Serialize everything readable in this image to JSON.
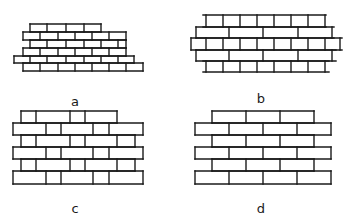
{
  "figure": {
    "panels": [
      {
        "id": "a",
        "label": "a",
        "label_pos": [
          75,
          95
        ],
        "description": "Stepped/raking brick bond, courses offset progressively",
        "courses": [
          {
            "y0": 24,
            "y1": 32,
            "x0": 30,
            "x1": 101,
            "joints": [
              47,
              66,
              84
            ]
          },
          {
            "y0": 32,
            "y1": 40,
            "x0": 23,
            "x1": 126,
            "joints": [
              40,
              58,
              75,
              92,
              109
            ]
          },
          {
            "y0": 40,
            "y1": 48,
            "x0": 30,
            "x1": 126,
            "joints": [
              47,
              66,
              84,
              101,
              118
            ]
          },
          {
            "y0": 48,
            "y1": 56,
            "x0": 23,
            "x1": 126,
            "joints": [
              40,
              58,
              75,
              92,
              109
            ]
          },
          {
            "y0": 56,
            "y1": 63,
            "x0": 14,
            "x1": 134,
            "joints": [
              30,
              47,
              66,
              84,
              101,
              118
            ]
          },
          {
            "y0": 63,
            "y1": 71,
            "x0": 23,
            "x1": 143,
            "joints": [
              40,
              58,
              75,
              92,
              109,
              126
            ]
          }
        ]
      },
      {
        "id": "b",
        "label": "b",
        "label_pos": [
          261,
          92
        ],
        "description": "Alternating courses of headers and stretchers with projecting course lines",
        "courses": [
          {
            "y0": 15,
            "y1": 27,
            "x0": 203,
            "x1": 326,
            "joints": [
              206,
              223,
              240,
              257,
              274,
              291,
              308,
              325
            ],
            "line_ext": [
              203,
              326
            ]
          },
          {
            "y0": 27,
            "y1": 38,
            "x0": 196,
            "x1": 334,
            "joints": [
              196,
              229,
              263,
              298,
              332
            ],
            "line_ext": [
              196,
              334
            ]
          },
          {
            "y0": 38,
            "y1": 50,
            "x0": 191,
            "x1": 340,
            "joints": [
              191,
              206,
              223,
              240,
              257,
              274,
              291,
              308,
              325,
              340
            ],
            "line_ext": [
              191,
              342
            ]
          },
          {
            "y0": 50,
            "y1": 61,
            "x0": 196,
            "x1": 334,
            "joints": [
              196,
              229,
              263,
              298,
              332
            ],
            "line_ext": [
              196,
              336
            ]
          },
          {
            "y0": 61,
            "y1": 72,
            "x0": 203,
            "x1": 326,
            "joints": [
              206,
              223,
              240,
              257,
              274,
              291,
              308,
              325
            ],
            "line_ext": [
              203,
              329
            ]
          }
        ]
      },
      {
        "id": "c",
        "label": "c",
        "label_pos": [
          75,
          202
        ],
        "description": "Flemish-type bond: alternating headers and stretchers in each course",
        "courses": [
          {
            "y0": 111,
            "y1": 123,
            "x0": 21,
            "x1": 117,
            "joints": [
              36,
              70,
              85
            ]
          },
          {
            "y0": 123,
            "y1": 135,
            "x0": 13,
            "x1": 143,
            "joints": [
              46,
              61,
              93,
              109
            ]
          },
          {
            "y0": 135,
            "y1": 147,
            "x0": 21,
            "x1": 135,
            "joints": [
              36,
              70,
              85,
              117
            ]
          },
          {
            "y0": 147,
            "y1": 159,
            "x0": 13,
            "x1": 143,
            "joints": [
              46,
              61,
              93,
              109
            ]
          },
          {
            "y0": 159,
            "y1": 171,
            "x0": 21,
            "x1": 135,
            "joints": [
              36,
              70,
              85,
              117
            ]
          },
          {
            "y0": 171,
            "y1": 184,
            "x0": 13,
            "x1": 143,
            "joints": [
              46,
              61,
              93,
              109
            ]
          }
        ]
      },
      {
        "id": "d",
        "label": "d",
        "label_pos": [
          261,
          202
        ],
        "description": "Running/stretcher bond, half-brick offset between courses",
        "courses": [
          {
            "y0": 111,
            "y1": 123,
            "x0": 212,
            "x1": 314,
            "joints": [
              246,
              280
            ]
          },
          {
            "y0": 123,
            "y1": 135,
            "x0": 195,
            "x1": 331,
            "joints": [
              229,
              263,
              297
            ]
          },
          {
            "y0": 135,
            "y1": 147,
            "x0": 212,
            "x1": 314,
            "joints": [
              246,
              280
            ]
          },
          {
            "y0": 147,
            "y1": 159,
            "x0": 195,
            "x1": 331,
            "joints": [
              229,
              263,
              297
            ]
          },
          {
            "y0": 159,
            "y1": 171,
            "x0": 212,
            "x1": 314,
            "joints": [
              246,
              280
            ]
          },
          {
            "y0": 171,
            "y1": 184,
            "x0": 195,
            "x1": 331,
            "joints": [
              229,
              263,
              297
            ]
          }
        ]
      }
    ],
    "colors": {
      "line": "#1a1a1a",
      "background": "#ffffff"
    }
  }
}
